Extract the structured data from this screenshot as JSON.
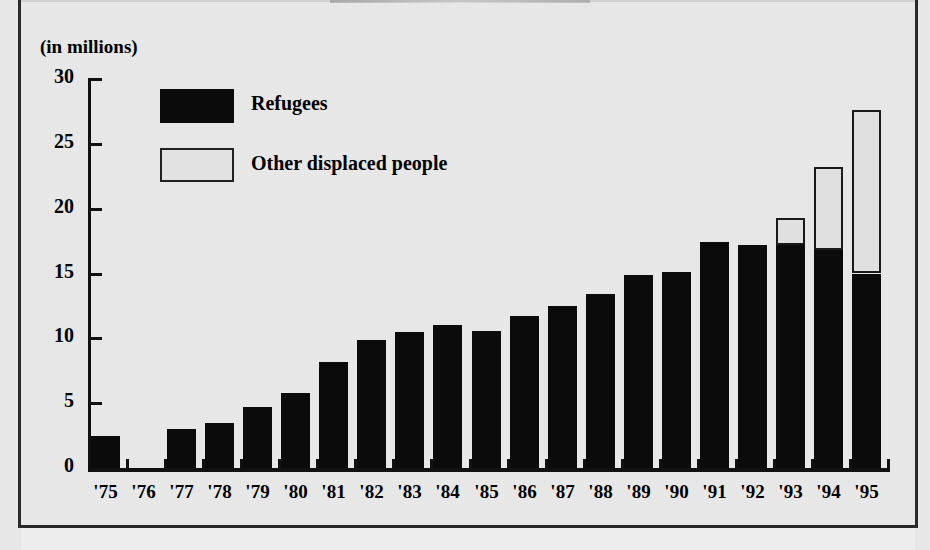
{
  "figure": {
    "y_axis_caption": "(in millions)",
    "background_color": "#e9e9e9",
    "refugees_color": "#0b0b0b",
    "other_displaced_color": "#e2e2e2",
    "axis_color": "#111111"
  },
  "legend": {
    "position": "inside-top-left",
    "entries": [
      {
        "label": "Refugees",
        "swatch": "black-filled-rect"
      },
      {
        "label": "Other displaced people",
        "swatch": "white-outlined-rect"
      }
    ]
  },
  "chart_data": {
    "type": "bar",
    "title": "",
    "subtitle": "",
    "xlabel": "",
    "ylabel": "(in millions)",
    "ylim": [
      0,
      30
    ],
    "yticks": [
      0,
      5,
      10,
      15,
      20,
      25,
      30
    ],
    "ytick_labels": [
      "0",
      "5",
      "10",
      "15",
      "20",
      "25",
      "30"
    ],
    "grid": false,
    "stacked": true,
    "legend_position": "inside-top-left",
    "categories": [
      "'75",
      "'76",
      "'77",
      "'78",
      "'79",
      "'80",
      "'81",
      "'82",
      "'83",
      "'84",
      "'85",
      "'86",
      "'87",
      "'88",
      "'89",
      "'90",
      "'91",
      "'92",
      "'93",
      "'94",
      "'95"
    ],
    "series": [
      {
        "name": "Refugees",
        "color": "#0b0b0b",
        "values": [
          2.5,
          0,
          3.0,
          3.5,
          4.7,
          5.8,
          8.2,
          9.9,
          10.5,
          11.0,
          10.6,
          11.7,
          12.5,
          13.4,
          14.9,
          15.1,
          17.4,
          17.2,
          17.2,
          16.8,
          15.0
        ]
      },
      {
        "name": "Other displaced people",
        "color": "#e2e2e2",
        "values": [
          0,
          0,
          0,
          0,
          0,
          0,
          0,
          0,
          0,
          0,
          0,
          0,
          0,
          0,
          0,
          0,
          0,
          0,
          2.1,
          6.4,
          12.6
        ]
      }
    ],
    "totals": [
      2.5,
      0,
      3.0,
      3.5,
      4.7,
      5.8,
      8.2,
      9.9,
      10.5,
      11.0,
      10.6,
      11.7,
      12.5,
      13.4,
      14.9,
      15.1,
      17.4,
      17.2,
      19.3,
      23.2,
      27.6
    ]
  }
}
